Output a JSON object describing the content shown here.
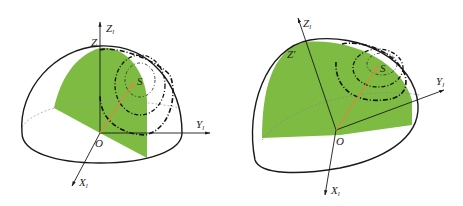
{
  "figure": {
    "colors": {
      "hemisphere_fill": "#7dbb43",
      "outline": "#1a1a1a",
      "vector": "#d98a3a",
      "background": "#ffffff"
    },
    "left_panel": {
      "axis_labels": {
        "z_axis": "Z",
        "z_sub": "l",
        "z_prime": "Z",
        "y_axis": "Y",
        "y_sub": "l",
        "x_axis": "X",
        "x_sub": "l",
        "origin": "O",
        "point": "S"
      }
    },
    "right_panel": {
      "axis_labels": {
        "z_axis": "Z",
        "z_sub": "l",
        "z_prime": "Z'",
        "y_axis": "Y",
        "y_sub": "l",
        "x_axis": "X",
        "x_sub": "l",
        "origin": "O",
        "point": "S"
      }
    }
  }
}
